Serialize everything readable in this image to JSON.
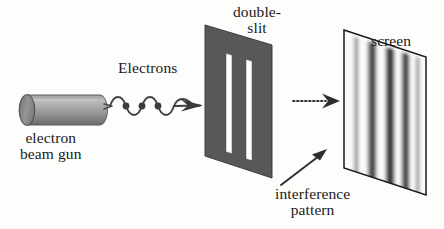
{
  "figure": {
    "labels": {
      "electrons": "Electrons",
      "gun": "electron\nbeam gun",
      "double_slit": "double-\nslit",
      "screen": "screen",
      "interference": "interference\npattern"
    },
    "colors": {
      "background": "#fdfdfc",
      "ink": "#1a1a1a",
      "barrier_fill": "#58585a",
      "barrier_edge": "#2e2e30",
      "slit_fill": "#ffffff",
      "gun_body_light": "#b8b8b8",
      "gun_body_mid": "#9a9a9a",
      "gun_body_dark": "#6e6e6e",
      "gun_cap": "#8a8a8a",
      "screen_fill": "#fbfbfb",
      "screen_edge": "#1a1a1a",
      "fringe_dark": "#3a3a3c",
      "wave_stroke": "#404042",
      "electron_dot": "#3c3c3e"
    },
    "elements": {
      "electron_gun": {
        "name": "electron beam gun",
        "shape": "cylinder",
        "x": 14,
        "y": 95,
        "width": 92,
        "height": 30
      },
      "electron_beam": {
        "name": "wavy electron beam with arrow",
        "wave_cycles": 3,
        "electron_count": 3,
        "start_x": 113,
        "end_x": 203,
        "axis_y": 106
      },
      "barrier": {
        "name": "double-slit barrier",
        "slit_count": 2,
        "top_left": [
          205,
          25
        ],
        "top_right": [
          272,
          45
        ],
        "bottom_right": [
          272,
          178
        ],
        "bottom_left": [
          205,
          156
        ]
      },
      "dotted_arrow": {
        "name": "propagation arrow",
        "from_x": 294,
        "to_x": 340,
        "y": 101
      },
      "screen": {
        "name": "detection screen",
        "fringe_count": 5,
        "top_left": [
          344,
          30
        ],
        "top_right": [
          426,
          57
        ],
        "bottom_right": [
          426,
          195
        ],
        "bottom_left": [
          344,
          168
        ]
      },
      "interference_arrow": {
        "name": "pointer from interference pattern label to screen",
        "from_x": 281,
        "from_y": 186,
        "to_x": 325,
        "to_y": 152
      }
    }
  }
}
